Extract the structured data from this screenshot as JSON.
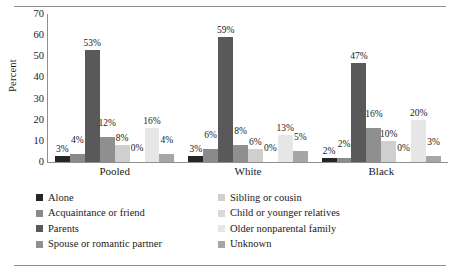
{
  "chart_data": {
    "type": "bar",
    "title": "",
    "xlabel": "",
    "ylabel": "Percent",
    "ylim": [
      0,
      70
    ],
    "yticks": [
      70,
      60,
      50,
      40,
      30,
      20,
      10,
      0
    ],
    "grid": false,
    "legend_position": "bottom",
    "categories": [
      "Pooled",
      "White",
      "Black"
    ],
    "series": [
      {
        "name": "Alone",
        "color": "#262626",
        "values": [
          3,
          3,
          2
        ],
        "labels": [
          "3%",
          "3%",
          "2%"
        ]
      },
      {
        "name": "Acquaintance or friend",
        "color": "#8a8a8a",
        "values": [
          4,
          6,
          2
        ],
        "labels": [
          "4%",
          "6%",
          "2%"
        ]
      },
      {
        "name": "Parents",
        "color": "#595959",
        "values": [
          53,
          59,
          47
        ],
        "labels": [
          "53%",
          "59%",
          "47%"
        ]
      },
      {
        "name": "Spouse or romantic partner",
        "color": "#8f8f8f",
        "values": [
          12,
          8,
          16
        ],
        "labels": [
          "12%",
          "8%",
          "16%"
        ]
      },
      {
        "name": "Sibling or cousin",
        "color": "#cfcfcf",
        "values": [
          8,
          6,
          10
        ],
        "labels": [
          "8%",
          "6%",
          "10%"
        ]
      },
      {
        "name": "Child or younger relatives",
        "color": "#d9d9d9",
        "values": [
          0,
          0,
          0
        ],
        "labels": [
          "0%",
          "0%",
          "0%"
        ]
      },
      {
        "name": "Older nonparental family",
        "color": "#e6e6e6",
        "values": [
          16,
          13,
          20
        ],
        "labels": [
          "16%",
          "13%",
          "20%"
        ]
      },
      {
        "name": "Unknown",
        "color": "#a6a6a6",
        "values": [
          4,
          5,
          3
        ],
        "labels": [
          "4%",
          "5%",
          "3%"
        ]
      }
    ]
  },
  "legend": {
    "items": [
      {
        "label": "Alone",
        "color": "#262626"
      },
      {
        "label": "Acquaintance or friend",
        "color": "#8a8a8a"
      },
      {
        "label": "Parents",
        "color": "#595959"
      },
      {
        "label": "Spouse or romantic partner",
        "color": "#8f8f8f"
      },
      {
        "label": "Sibling or cousin",
        "color": "#cfcfcf"
      },
      {
        "label": "Child or younger relatives",
        "color": "#d9d9d9"
      },
      {
        "label": "Older nonparental family",
        "color": "#e6e6e6"
      },
      {
        "label": "Unknown",
        "color": "#a6a6a6"
      }
    ]
  }
}
